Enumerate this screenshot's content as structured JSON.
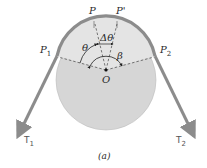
{
  "diagram": {
    "caption": "(a)",
    "points": {
      "P": "P",
      "P_prime": "P'",
      "P1": "P",
      "P1_sub": "1",
      "P2": "P",
      "P2_sub": "2",
      "O": "O"
    },
    "angles": {
      "theta": "θ",
      "delta_theta": "Δθ",
      "beta": "β"
    },
    "tensions": {
      "T1": "T",
      "T1_sub": "1",
      "T2": "T",
      "T2_sub": "2"
    },
    "colors": {
      "drum_fill": "#d8d8d8",
      "drum_top_fill": "#e6e6e6",
      "belt": "#8c8c8c",
      "dashed_line": "#444444",
      "text": "#2a2a2a"
    }
  }
}
